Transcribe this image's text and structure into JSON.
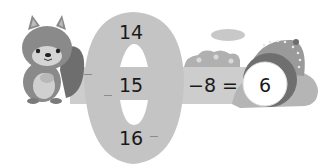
{
  "puzzle": {
    "wheel_numbers": [
      "14",
      "15",
      "16"
    ],
    "operator": "−",
    "operand": "8",
    "equals": "=",
    "result": "6"
  },
  "colors": {
    "wheel": "#c4c4c4",
    "band": "#cdcdcd",
    "squirrel_body": "#8a8a8a",
    "squirrel_belly": "#d0d0d0",
    "bush": "#b5b5b5",
    "hole_ring": "#6f6f6f",
    "text": "#1a1a1a"
  }
}
